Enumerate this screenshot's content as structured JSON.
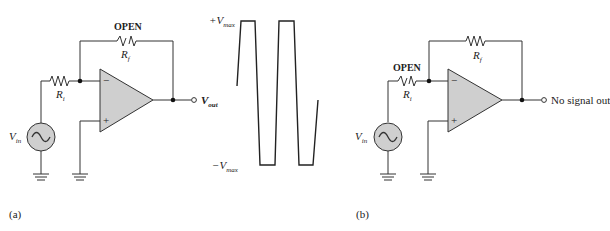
{
  "figure_a": {
    "label": "(a)",
    "rf_status": "OPEN",
    "rf_label": "R",
    "rf_sub": "f",
    "ri_label": "R",
    "ri_sub": "i",
    "vin_label": "V",
    "vin_sub": "in",
    "vout_label": "V",
    "vout_sub": "out",
    "inv_input": "−",
    "noninv_input": "+"
  },
  "waveform": {
    "vmax_pos_label": "+V",
    "vmax_pos_sub": "max",
    "vmax_neg_label": "−V",
    "vmax_neg_sub": "max",
    "shape": "clipped square wave swinging between +Vmax and −Vmax"
  },
  "figure_b": {
    "label": "(b)",
    "ri_status": "OPEN",
    "rf_label": "R",
    "rf_sub": "f",
    "ri_label": "R",
    "ri_sub": "i",
    "vin_label": "V",
    "vin_sub": "in",
    "output_text": "No signal out",
    "inv_input": "−",
    "noninv_input": "+"
  }
}
